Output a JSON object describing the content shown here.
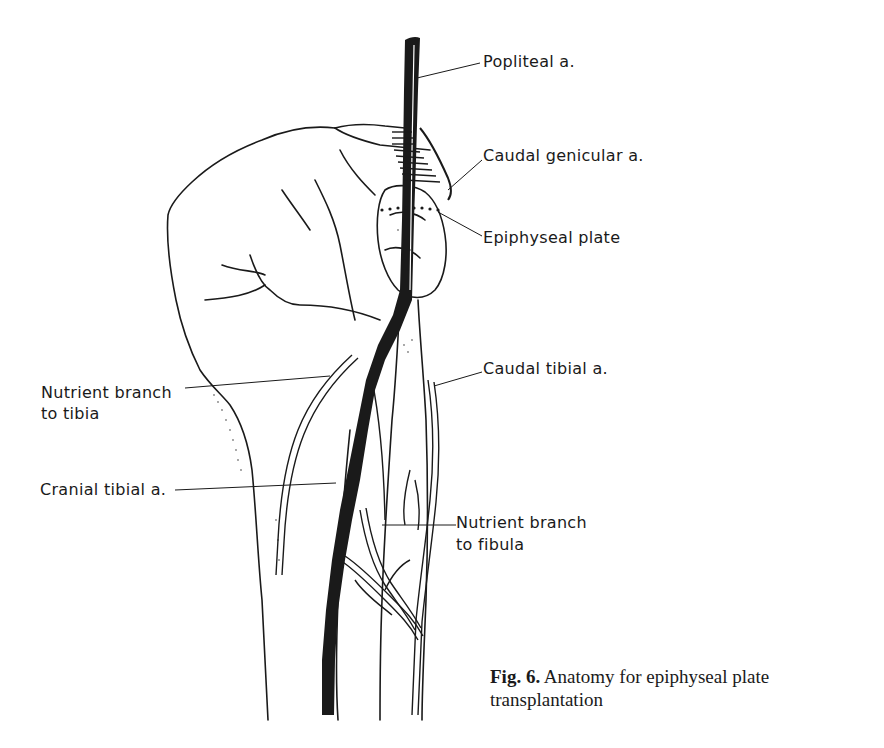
{
  "header": {
    "faint_text": ""
  },
  "labels": {
    "popliteal": "Popliteal a.",
    "caudal_genicular": "Caudal genicular a.",
    "epiphyseal_plate": "Epiphyseal plate",
    "nutrient_tibia_line1": "Nutrient branch",
    "nutrient_tibia_line2": "to tibia",
    "caudal_tibial": "Caudal tibial a.",
    "cranial_tibial": "Cranial tibial a.",
    "nutrient_fibula_line1": "Nutrient branch",
    "nutrient_fibula_line2": "to fibula"
  },
  "caption": {
    "prefix": "Fig. 6.",
    "text": " Anatomy for epiphyseal plate transplantation"
  },
  "colors": {
    "ink": "#1a1a1a",
    "background": "#ffffff"
  }
}
